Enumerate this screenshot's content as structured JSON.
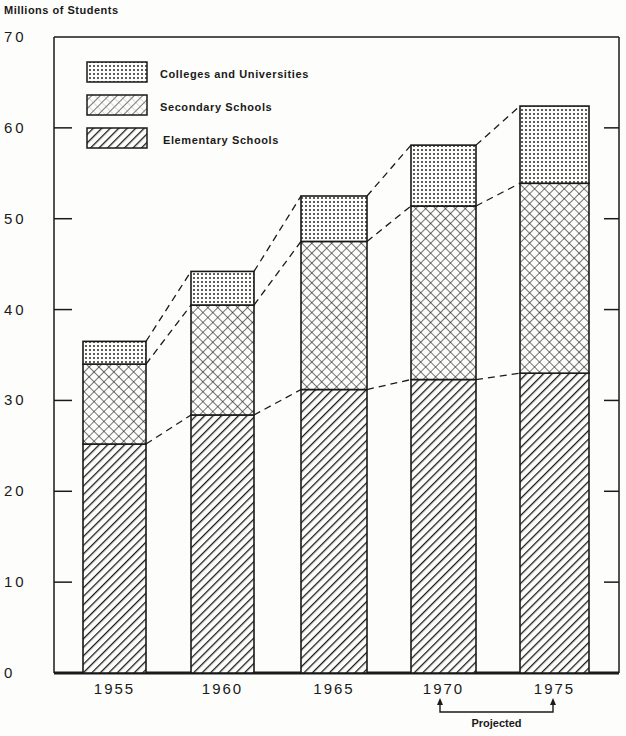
{
  "chart_data": {
    "type": "bar",
    "stacked": true,
    "title": "",
    "ylabel": "Millions of Students",
    "xlabel": "",
    "ylim": [
      0,
      70
    ],
    "yticks": [
      0,
      10,
      20,
      30,
      40,
      50,
      60,
      70
    ],
    "ytick_labels": [
      "0",
      "10",
      "20",
      "30",
      "40",
      "50",
      "60",
      "70"
    ],
    "categories": [
      "1955",
      "1960",
      "1965",
      "1970",
      "1975"
    ],
    "series": [
      {
        "name": "Elementary Schools",
        "pattern": "diagonal-hatch",
        "values": [
          25.2,
          28.4,
          31.2,
          32.3,
          33.0
        ]
      },
      {
        "name": "Secondary Schools",
        "pattern": "crosshatch",
        "values": [
          8.8,
          12.1,
          16.3,
          19.1,
          20.9
        ]
      },
      {
        "name": "Colleges and Universities",
        "pattern": "dotted",
        "values": [
          2.5,
          3.7,
          5.0,
          6.7,
          8.5
        ]
      }
    ],
    "totals": [
      36.5,
      44.2,
      52.5,
      58.1,
      62.4
    ],
    "legend": {
      "position": "upper-left",
      "entries": [
        "Colleges and Universities",
        "Secondary Schools",
        "Elementary Schools"
      ]
    },
    "annotations": [
      {
        "text": "Projected",
        "spans": [
          "1970",
          "1975"
        ]
      }
    ],
    "connector_lines": "dashed lines connecting segment tops between adjacent bars",
    "grid": false
  },
  "colors": {
    "ink": "#1a1a1a",
    "paper": "#fdfdfb"
  }
}
